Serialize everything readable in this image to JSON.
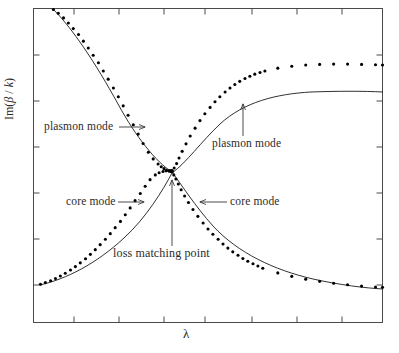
{
  "figure": {
    "background": "#ffffff",
    "frame_color": "#3a3a3a",
    "curve_color": "#1a1a1a",
    "marker_color": "#000000"
  },
  "axes": {
    "xlabel": "λ",
    "ylabel_prefix": "Im(",
    "ylabel_beta": "β",
    "ylabel_slash": " / ",
    "ylabel_k": "k",
    "ylabel_suffix": ")",
    "ylabel_full": "Im( β / k )"
  },
  "annotations": {
    "plasmon_left": "plasmon mode",
    "plasmon_right": "plasmon mode",
    "core_left": "core mode",
    "core_right": "core mode",
    "loss_point": "loss matching point"
  },
  "chart_data": {
    "type": "line",
    "title": "",
    "xlabel": "λ",
    "ylabel": "Im( β / k )",
    "xlim": [
      0,
      1
    ],
    "ylim": [
      0,
      1
    ],
    "grid": false,
    "legend": "none",
    "axis_ticks": {
      "x_major_count": 7,
      "y_major_count": 6,
      "x_tick_labels": [],
      "y_tick_labels": [],
      "ticks_direction": "inward",
      "ticks_on_all_sides": true
    },
    "note": "Anti-crossing of two guided modes; loss matching point where the two branches exchange character. Axes are unlabelled (arbitrary units).",
    "crossing_point": {
      "x": 0.397,
      "y": 0.48
    },
    "series": [
      {
        "name": "plasmon mode (short wavelength branch)",
        "marker": "dot",
        "x": [
          0.057,
          0.071,
          0.086,
          0.1,
          0.114,
          0.129,
          0.143,
          0.157,
          0.171,
          0.186,
          0.2,
          0.214,
          0.229,
          0.243,
          0.257,
          0.271,
          0.286,
          0.3,
          0.314,
          0.329,
          0.343,
          0.357,
          0.366,
          0.374,
          0.381,
          0.389,
          0.394,
          0.397
        ],
        "y": [
          0.997,
          0.985,
          0.97,
          0.954,
          0.936,
          0.917,
          0.896,
          0.874,
          0.851,
          0.827,
          0.801,
          0.775,
          0.747,
          0.719,
          0.69,
          0.66,
          0.63,
          0.6,
          0.57,
          0.542,
          0.521,
          0.505,
          0.496,
          0.49,
          0.485,
          0.482,
          0.481,
          0.48
        ]
      },
      {
        "name": "core mode (short wavelength branch)",
        "marker": "dot",
        "x": [
          0.02,
          0.034,
          0.049,
          0.063,
          0.077,
          0.091,
          0.106,
          0.12,
          0.134,
          0.149,
          0.163,
          0.177,
          0.191,
          0.206,
          0.22,
          0.234,
          0.249,
          0.263,
          0.277,
          0.291,
          0.306,
          0.32,
          0.334,
          0.349,
          0.36,
          0.371,
          0.38,
          0.388,
          0.394,
          0.397
        ],
        "y": [
          0.122,
          0.127,
          0.133,
          0.14,
          0.148,
          0.157,
          0.167,
          0.178,
          0.19,
          0.203,
          0.217,
          0.232,
          0.248,
          0.265,
          0.283,
          0.302,
          0.322,
          0.343,
          0.365,
          0.388,
          0.411,
          0.434,
          0.455,
          0.47,
          0.477,
          0.481,
          0.483,
          0.484,
          0.484,
          0.483
        ]
      },
      {
        "name": "plasmon mode (long wavelength branch)",
        "marker": "dot",
        "x": [
          0.397,
          0.403,
          0.41,
          0.417,
          0.426,
          0.437,
          0.449,
          0.463,
          0.477,
          0.491,
          0.506,
          0.52,
          0.534,
          0.549,
          0.563,
          0.577,
          0.591,
          0.606,
          0.62,
          0.634,
          0.649,
          0.663,
          0.7,
          0.74,
          0.78,
          0.82,
          0.86,
          0.9,
          0.94,
          0.98,
          1.0
        ],
        "y": [
          0.483,
          0.492,
          0.506,
          0.524,
          0.545,
          0.569,
          0.594,
          0.619,
          0.643,
          0.665,
          0.685,
          0.703,
          0.719,
          0.734,
          0.747,
          0.758,
          0.768,
          0.777,
          0.784,
          0.791,
          0.796,
          0.801,
          0.81,
          0.816,
          0.82,
          0.822,
          0.823,
          0.823,
          0.822,
          0.821,
          0.82
        ]
      },
      {
        "name": "core mode (long wavelength branch)",
        "marker": "dot",
        "x": [
          0.397,
          0.402,
          0.408,
          0.415,
          0.423,
          0.433,
          0.444,
          0.457,
          0.471,
          0.486,
          0.5,
          0.514,
          0.529,
          0.543,
          0.557,
          0.571,
          0.586,
          0.6,
          0.614,
          0.629,
          0.643,
          0.657,
          0.7,
          0.74,
          0.78,
          0.82,
          0.86,
          0.9,
          0.94,
          0.98,
          1.0
        ],
        "y": [
          0.48,
          0.47,
          0.457,
          0.441,
          0.423,
          0.403,
          0.382,
          0.36,
          0.338,
          0.317,
          0.298,
          0.281,
          0.265,
          0.25,
          0.237,
          0.225,
          0.214,
          0.204,
          0.195,
          0.187,
          0.18,
          0.173,
          0.158,
          0.147,
          0.138,
          0.131,
          0.125,
          0.12,
          0.116,
          0.113,
          0.112
        ]
      }
    ],
    "annotations": [
      {
        "text": "plasmon mode",
        "type": "arrow-right",
        "target_x": 0.335,
        "target_y": 0.565
      },
      {
        "text": "plasmon mode",
        "type": "arrow-up",
        "target_x": 0.56,
        "target_y": 0.742
      },
      {
        "text": "core mode",
        "type": "arrow-right",
        "target_x": 0.33,
        "target_y": 0.425
      },
      {
        "text": "core mode",
        "type": "arrow-left",
        "target_x": 0.455,
        "target_y": 0.363
      },
      {
        "text": "loss matching point",
        "type": "arrow-up",
        "target_x": 0.397,
        "target_y": 0.468
      }
    ]
  }
}
